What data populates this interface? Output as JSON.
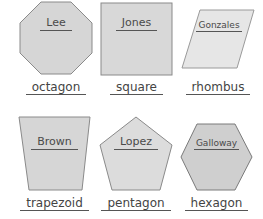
{
  "colors": {
    "shape_fill": "#d6d6d6",
    "shape_stroke": "#8a8a8a",
    "text": "#444444"
  },
  "shapes": [
    {
      "name": "Lee",
      "shape": "octagon"
    },
    {
      "name": "Jones",
      "shape": "square"
    },
    {
      "name": "Gonzales",
      "shape": "rhombus"
    },
    {
      "name": "Brown",
      "shape": "trapezoid"
    },
    {
      "name": "Lopez",
      "shape": "pentagon"
    },
    {
      "name": "Galloway",
      "shape": "hexagon"
    }
  ]
}
